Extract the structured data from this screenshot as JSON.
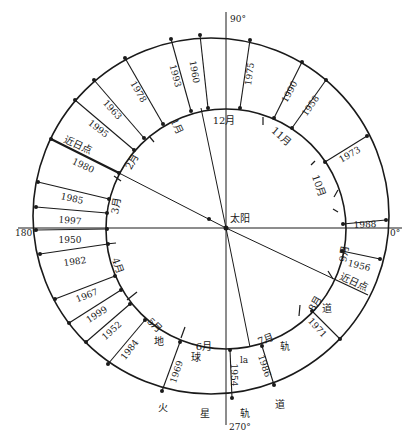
{
  "diagram": {
    "title": "",
    "sun": {
      "label": "太阳",
      "x": 226,
      "y": 228,
      "label_x": 230,
      "label_y": 222
    },
    "earth_orbit": {
      "cx": 226,
      "cy": 229,
      "r": 120
    },
    "mars_orbit": {
      "cx": 211,
      "cy": 216,
      "r": 178
    },
    "axes": [
      {
        "label": "90°",
        "x1": 226,
        "y1": 12,
        "x2": 226,
        "y2": 228,
        "lx": 230,
        "ly": 22
      },
      {
        "label": "270°",
        "x1": 226,
        "y1": 228,
        "x2": 226,
        "y2": 425,
        "lx": 229,
        "ly": 430
      },
      {
        "label": "180°",
        "x1": 18,
        "y1": 228,
        "x2": 226,
        "y2": 228,
        "lx": 15,
        "ly": 236
      },
      {
        "label": "0°",
        "x1": 226,
        "y1": 228,
        "x2": 402,
        "y2": 228,
        "lx": 390,
        "ly": 236
      }
    ],
    "sun_lines": [
      {
        "name": "aphelion-line",
        "x1": 226,
        "y1": 228,
        "x2": 119,
        "y2": 173
      },
      {
        "name": "perihelion-line",
        "x1": 226,
        "y1": 228,
        "x2": 334,
        "y2": 279
      },
      {
        "name": "upper-line",
        "x1": 226,
        "y1": 228,
        "x2": 201,
        "y2": 108
      },
      {
        "name": "lower-line",
        "x1": 226,
        "y1": 228,
        "x2": 250,
        "y2": 347
      }
    ],
    "opposition_lines": [
      {
        "year": "1960",
        "ox": 200,
        "oy": 35,
        "ix": 208,
        "iy": 108,
        "tx": 194,
        "ty": 72,
        "rot": 80
      },
      {
        "year": "1993",
        "ox": 171,
        "oy": 39,
        "ix": 191,
        "iy": 111,
        "tx": 175,
        "ty": 76,
        "rot": 75
      },
      {
        "year": "1978",
        "ox": 125,
        "oy": 58,
        "ix": 163,
        "iy": 124,
        "tx": 138,
        "ty": 92,
        "rot": 60
      },
      {
        "year": "1963",
        "ox": 94,
        "oy": 80,
        "ix": 144,
        "iy": 138,
        "tx": 112,
        "ty": 110,
        "rot": 48
      },
      {
        "year": "1995",
        "ox": 75,
        "oy": 100,
        "ix": 134,
        "iy": 150,
        "tx": 98,
        "ty": 129,
        "rot": 38
      },
      {
        "year": "1980",
        "ox": 51,
        "oy": 139,
        "ix": 119,
        "iy": 173,
        "tx": 83,
        "ty": 166,
        "rot": 25
      },
      {
        "year": "1985",
        "ox": 38,
        "oy": 182,
        "ix": 109,
        "iy": 199,
        "tx": 72,
        "ty": 199,
        "rot": 12
      },
      {
        "year": "1997",
        "ox": 36,
        "oy": 207,
        "ix": 107,
        "iy": 213,
        "tx": 70,
        "ty": 221,
        "rot": 5
      },
      {
        "year": "1950",
        "ox": 36,
        "oy": 230,
        "ix": 107,
        "iy": 229,
        "tx": 70,
        "ty": 240,
        "rot": 0
      },
      {
        "year": "1982",
        "ox": 40,
        "oy": 254,
        "ix": 108,
        "iy": 244,
        "tx": 75,
        "ty": 262,
        "rot": -8
      },
      {
        "year": "1967",
        "ox": 55,
        "oy": 299,
        "ix": 115,
        "iy": 276,
        "tx": 87,
        "ty": 296,
        "rot": -22
      },
      {
        "year": "1999",
        "ox": 69,
        "oy": 323,
        "ix": 121,
        "iy": 290,
        "tx": 97,
        "ty": 315,
        "rot": -33
      },
      {
        "year": "1952",
        "ox": 86,
        "oy": 342,
        "ix": 130,
        "iy": 304,
        "tx": 112,
        "ty": 331,
        "rot": -42
      },
      {
        "year": "1984",
        "ox": 108,
        "oy": 364,
        "ix": 145,
        "iy": 320,
        "tx": 130,
        "ty": 350,
        "rot": -52
      },
      {
        "year": "1969",
        "ox": 162,
        "oy": 391,
        "ix": 180,
        "iy": 342,
        "tx": 177,
        "ty": 372,
        "rot": -72
      },
      {
        "year": "1954",
        "ox": 232,
        "oy": 398,
        "ix": 230,
        "iy": 350,
        "tx": 233,
        "ty": 375,
        "rot": 90
      },
      {
        "year": "1986",
        "ox": 274,
        "oy": 385,
        "ix": 262,
        "iy": 346,
        "tx": 264,
        "ty": 366,
        "rot": 72
      },
      {
        "year": "1971",
        "ox": 340,
        "oy": 339,
        "ix": 312,
        "iy": 311,
        "tx": 317,
        "ty": 328,
        "rot": 48
      },
      {
        "year": "1956",
        "ox": 380,
        "oy": 259,
        "ix": 342,
        "iy": 251,
        "tx": 359,
        "ty": 266,
        "rot": 14
      },
      {
        "year": "1988",
        "ox": 386,
        "oy": 220,
        "ix": 343,
        "iy": 224,
        "tx": 365,
        "ty": 225,
        "rot": -3
      },
      {
        "year": "1973",
        "ox": 367,
        "oy": 136,
        "ix": 325,
        "iy": 162,
        "tx": 350,
        "ty": 155,
        "rot": -30
      },
      {
        "year": "1958",
        "ox": 326,
        "oy": 80,
        "ix": 292,
        "iy": 128,
        "tx": 311,
        "ty": 106,
        "rot": -55
      },
      {
        "year": "1990",
        "ox": 302,
        "oy": 62,
        "ix": 274,
        "iy": 118,
        "tx": 290,
        "ty": 92,
        "rot": -62
      },
      {
        "year": "1975",
        "ox": 250,
        "oy": 40,
        "ix": 240,
        "iy": 108,
        "tx": 250,
        "ty": 74,
        "rot": -82
      }
    ],
    "perihelion_line": {
      "label": "近日点",
      "ox": 368,
      "oy": 295,
      "ix": 334,
      "iy": 279,
      "tx": 354,
      "ty": 283,
      "rot": 25
    },
    "aphelion_label": {
      "label": "近日点",
      "tx": 78,
      "ty": 146,
      "rot": 25
    },
    "months": [
      {
        "label": "1月",
        "x": 176,
        "y": 127,
        "rot": 65
      },
      {
        "label": "2月",
        "x": 133,
        "y": 162,
        "rot": -60
      },
      {
        "label": "3月",
        "x": 117,
        "y": 206,
        "rot": -80
      },
      {
        "label": "4月",
        "x": 117,
        "y": 266,
        "rot": 70
      },
      {
        "label": "5月",
        "x": 154,
        "y": 326,
        "rot": 45
      },
      {
        "label": "6月",
        "x": 204,
        "y": 347,
        "rot": 0
      },
      {
        "label": "7月",
        "x": 266,
        "y": 340,
        "rot": -20
      },
      {
        "label": "8月",
        "x": 316,
        "y": 304,
        "rot": -60
      },
      {
        "label": "9月",
        "x": 345,
        "y": 254,
        "rot": -80
      },
      {
        "label": "10月",
        "x": 318,
        "y": 186,
        "rot": 70
      },
      {
        "label": "11月",
        "x": 281,
        "y": 137,
        "rot": 40
      },
      {
        "label": "12月",
        "x": 224,
        "y": 121,
        "rot": 0
      }
    ],
    "month_ticks": [
      {
        "x1": 149,
        "y1": 136,
        "x2": 154,
        "y2": 142
      },
      {
        "x1": 114,
        "y1": 176,
        "x2": 121,
        "y2": 181
      },
      {
        "x1": 106,
        "y1": 244,
        "x2": 116,
        "y2": 243
      },
      {
        "x1": 127,
        "y1": 300,
        "x2": 137,
        "y2": 292
      },
      {
        "x1": 181,
        "y1": 338,
        "x2": 185,
        "y2": 327
      },
      {
        "x1": 299,
        "y1": 316,
        "x2": 300,
        "y2": 305
      },
      {
        "x1": 333,
        "y1": 279,
        "x2": 328,
        "y2": 271
      },
      {
        "x1": 334,
        "y1": 197,
        "x2": 338,
        "y2": 190
      },
      {
        "x1": 333,
        "y1": 209,
        "x2": 338,
        "y2": 212
      },
      {
        "x1": 263,
        "y1": 117,
        "x2": 263,
        "y2": 125
      },
      {
        "x1": 311,
        "y1": 165,
        "x2": 315,
        "y2": 161
      }
    ],
    "earth_orbit_label": [
      {
        "char": "地",
        "x": 159,
        "y": 342
      },
      {
        "char": "球",
        "x": 196,
        "y": 358
      },
      {
        "char": "轨",
        "x": 285,
        "y": 347
      },
      {
        "char": "道",
        "x": 327,
        "y": 309
      }
    ],
    "mars_orbit_label": [
      {
        "char": "火",
        "x": 163,
        "y": 408
      },
      {
        "char": "星",
        "x": 205,
        "y": 414
      },
      {
        "char": "轨",
        "x": 245,
        "y": 414
      },
      {
        "char": "道",
        "x": 280,
        "y": 405
      }
    ],
    "misc_label": {
      "text": "la",
      "x": 244,
      "y": 360
    },
    "colors": {
      "line": "#1a1a1a",
      "background": "#ffffff"
    }
  }
}
